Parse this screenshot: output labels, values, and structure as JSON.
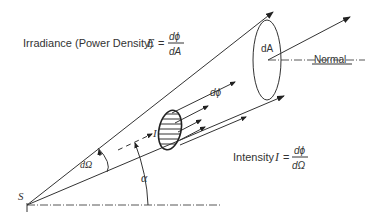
{
  "diagram": {
    "labels": {
      "irradiance_prefix": "Irradiance (Power Density) ",
      "irradiance_symbol": "E",
      "equals": "=",
      "irradiance_numerator": "dϕ",
      "irradiance_denominator": "dA",
      "intensity_prefix": "Intensity ",
      "intensity_symbol": "I",
      "intensity_numerator": "dϕ",
      "intensity_denominator": "dΩ",
      "area_label": "dA",
      "normal_label": "Normal",
      "flux_label": "dϕ",
      "intensity_arrow_label": "I",
      "solid_angle_label": "dΩ",
      "angle_label": "α",
      "source_label": "S"
    },
    "colors": {
      "stroke": "#333333",
      "background": "#ffffff"
    }
  }
}
